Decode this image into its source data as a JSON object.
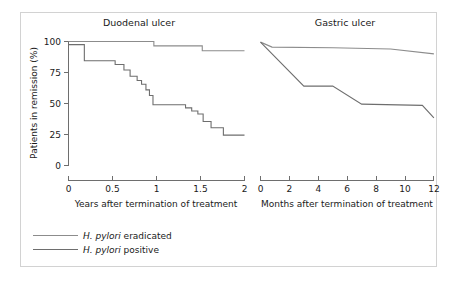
{
  "figure": {
    "background_color": "#ffffff",
    "frame_color": "#d2d2d2",
    "axis_color": "#6e6e6e",
    "text_color": "#1a1a1a",
    "y_axis_title": "Patients in remission (%)"
  },
  "legend": {
    "position": "bottom-left",
    "items": [
      {
        "label_italic": "H. pylori",
        "label_rest": " eradicated",
        "label_full": "H. pylori eradicated",
        "color": "#8c8c8c"
      },
      {
        "label_italic": "H. pylori",
        "label_rest": " positive",
        "label_full": "H. pylori positive",
        "color": "#6e6e6e"
      }
    ]
  },
  "chart_data": [
    {
      "type": "line",
      "title": "Duodenal ulcer",
      "xlabel": "Years after termination of treatment",
      "ylabel": "Patients in remission (%)",
      "xlim": [
        0,
        2
      ],
      "ylim": [
        0,
        100
      ],
      "xticks": [
        0,
        0.5,
        1,
        1.5,
        2
      ],
      "xtick_labels": [
        "0",
        "0.5",
        "1",
        "1.5",
        "2"
      ],
      "yticks": [
        0,
        25,
        50,
        75,
        100
      ],
      "ytick_labels": [
        "0",
        "25",
        "50",
        "75",
        "100"
      ],
      "grid": false,
      "step": "post",
      "series": [
        {
          "name": "H. pylori eradicated",
          "color": "#8c8c8c",
          "x": [
            0.0,
            0.97,
            0.97,
            1.52,
            1.52,
            2.0
          ],
          "y": [
            100,
            100,
            96.5,
            96.5,
            92.5,
            92.5
          ]
        },
        {
          "name": "H. pylori positive",
          "color": "#6e6e6e",
          "x": [
            0.0,
            0.18,
            0.18,
            0.53,
            0.53,
            0.63,
            0.63,
            0.7,
            0.7,
            0.78,
            0.78,
            0.83,
            0.83,
            0.88,
            0.88,
            0.92,
            0.92,
            0.96,
            0.96,
            1.33,
            1.33,
            1.4,
            1.4,
            1.47,
            1.47,
            1.53,
            1.53,
            1.62,
            1.62,
            1.76,
            1.76,
            2.0
          ],
          "y": [
            97.5,
            97.5,
            84.5,
            84.5,
            81.5,
            81.5,
            77.0,
            77.0,
            72.0,
            72.0,
            68.5,
            68.5,
            65.5,
            65.5,
            61.0,
            61.0,
            56.5,
            56.5,
            49.0,
            49.0,
            46.5,
            46.5,
            44.0,
            44.0,
            41.5,
            41.5,
            35.5,
            35.5,
            30.5,
            30.5,
            24.5,
            24.5
          ]
        }
      ]
    },
    {
      "type": "line",
      "title": "Gastric ulcer",
      "xlabel": "Months after termination of treatment",
      "ylabel": "Patients in remission (%)",
      "xlim": [
        0,
        12
      ],
      "ylim": [
        0,
        100
      ],
      "xticks": [
        0,
        2,
        4,
        6,
        8,
        10,
        12
      ],
      "xtick_labels": [
        "0",
        "2",
        "4",
        "6",
        "8",
        "10",
        "12"
      ],
      "yticks": [
        0,
        25,
        50,
        75,
        100
      ],
      "ytick_labels": [
        "0",
        "25",
        "50",
        "75",
        "100"
      ],
      "grid": false,
      "step": "linear",
      "series": [
        {
          "name": "H. pylori eradicated",
          "color": "#8c8c8c",
          "x": [
            0,
            0.8,
            5.0,
            9.0,
            12.0
          ],
          "y": [
            99.5,
            95.5,
            95.0,
            94.0,
            90.0
          ]
        },
        {
          "name": "H. pylori positive",
          "color": "#6e6e6e",
          "x": [
            0,
            3.0,
            5.0,
            7.0,
            11.2,
            12.0
          ],
          "y": [
            99.5,
            64.0,
            64.0,
            49.5,
            48.5,
            38.5
          ]
        }
      ]
    }
  ]
}
